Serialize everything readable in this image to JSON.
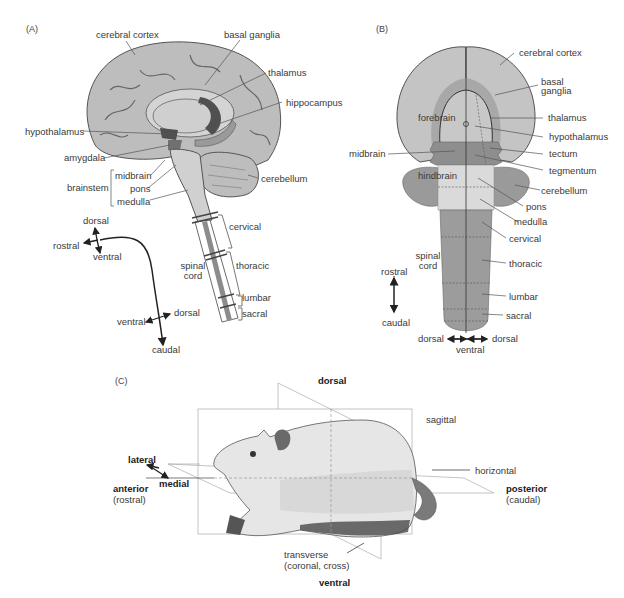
{
  "panels": {
    "A": {
      "tag": "(A)",
      "labels": {
        "cerebral_cortex": "cerebral cortex",
        "basal_ganglia": "basal ganglia",
        "thalamus": "thalamus",
        "hippocampus": "hippocampus",
        "hypothalamus": "hypothalamus",
        "amygdala": "amygdala",
        "brainstem": "brainstem",
        "midbrain": "midbrain",
        "pons": "pons",
        "medulla": "medulla",
        "cerebellum": "cerebellum",
        "cervical": "cervical",
        "spinal": "spinal",
        "cord": "cord",
        "thoracic": "thoracic",
        "lumbar": "lumbar",
        "sacral": "sacral"
      },
      "axes": {
        "dorsal_top": "dorsal",
        "rostral": "rostral",
        "ventral_top": "ventral",
        "ventral_bottom": "ventral",
        "dorsal_bottom": "dorsal",
        "caudal": "caudal"
      }
    },
    "B": {
      "tag": "(B)",
      "labels": {
        "cerebral_cortex": "cerebral cortex",
        "basal": "basal",
        "ganglia": "ganglia",
        "forebrain": "forebrain",
        "thalamus": "thalamus",
        "hypothalamus": "hypothalamus",
        "midbrain": "midbrain",
        "tectum": "tectum",
        "tegmentum": "tegmentum",
        "hindbrain": "hindbrain",
        "cerebellum": "cerebellum",
        "pons": "pons",
        "medulla": "medulla",
        "cervical": "cervical",
        "spinal": "spinal",
        "cord": "cord",
        "thoracic": "thoracic",
        "lumbar": "lumbar",
        "sacral": "sacral"
      },
      "axes": {
        "rostral": "rostral",
        "caudal": "caudal",
        "dorsal_left": "dorsal",
        "dorsal_right": "dorsal",
        "ventral": "ventral"
      }
    },
    "C": {
      "tag": "(C)",
      "labels": {
        "dorsal": "dorsal",
        "sagittal": "sagittal",
        "horizontal": "horizontal",
        "lateral": "lateral",
        "medial": "medial",
        "anterior": "anterior",
        "rostral": "(rostral)",
        "posterior": "posterior",
        "caudal": "(caudal)",
        "transverse": "transverse",
        "coronal_cross": "(coronal, cross)",
        "ventral": "ventral"
      }
    }
  },
  "colors": {
    "cortex_light": "#c4c4c4",
    "basal_ganglia": "#a8a8a8",
    "midbrain": "#8e8e8e",
    "hindbrain": "#9a9a9a",
    "pons_medulla": "#dadada",
    "spinal_cord": "#9c9c9c",
    "brain_fill": "#bdbdbd",
    "dark_region": "#505050",
    "line": "#555555",
    "plane": "#b5b5b5"
  }
}
